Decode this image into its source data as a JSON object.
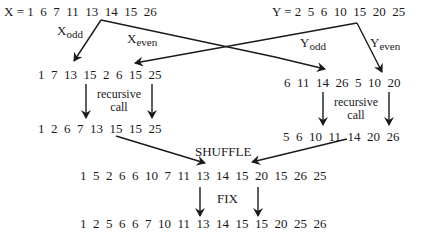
{
  "diagram": {
    "x_row": {
      "label": "X = ",
      "values": "1  6  7  11  13  14  15  26"
    },
    "y_row": {
      "label": "Y = ",
      "values": "2  5  6  10  15  20  25"
    },
    "labels": {
      "x_odd_main": "X",
      "x_odd_sub": "odd",
      "x_even_main": "X",
      "x_even_sub": "even",
      "y_odd_main": "Y",
      "y_odd_sub": "odd",
      "y_even_main": "Y",
      "y_even_sub": "even"
    },
    "left_split": "1  7  13  15  2  6  15  25",
    "right_split": "6  11  14  26  5  10  20",
    "recursive_left_1": "recursive",
    "recursive_left_2": "call",
    "recursive_right_1": "recursive",
    "recursive_right_2": "call",
    "left_sorted": "1  2  6  7  13  15  15  25",
    "right_sorted": "5  6  10  11  14  20  26",
    "shuffle_label": "SHUFFLE",
    "shuffled": "1  5  2  6  6  10  7  11  13  14  15  20  15  26  25",
    "fix_label": "FIX",
    "final": "1  2  5  6  6  7  10  11  13  14  15  15  20  25  26"
  },
  "colors": {
    "ink": "#1a1a1a",
    "background": "#ffffff"
  }
}
